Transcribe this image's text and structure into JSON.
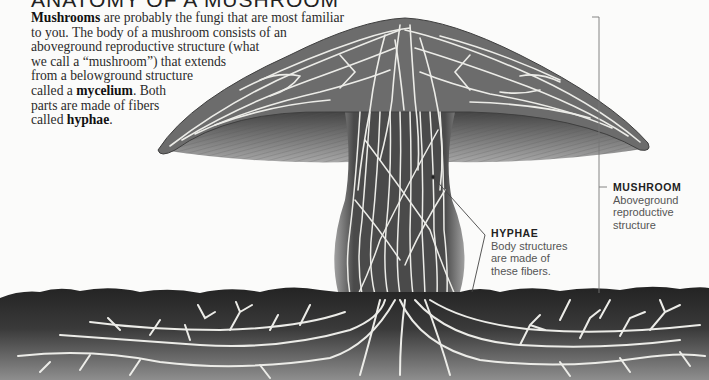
{
  "title": "ANATOMY OF A MUSHROOM",
  "intro": {
    "lines": [
      [
        {
          "text": "Mushrooms",
          "bold": true
        },
        {
          "text": " are probably the fungi that are most familiar",
          "bold": false
        }
      ],
      [
        {
          "text": "to you. The body of a mushroom consists of an",
          "bold": false
        }
      ],
      [
        {
          "text": "aboveground reproductive structure (what",
          "bold": false
        }
      ],
      [
        {
          "text": "we call a “mushroom”) that extends",
          "bold": false
        }
      ],
      [
        {
          "text": "from a belowground structure",
          "bold": false
        }
      ],
      [
        {
          "text": "called a ",
          "bold": false
        },
        {
          "text": "mycelium",
          "bold": true
        },
        {
          "text": ". Both",
          "bold": false
        }
      ],
      [
        {
          "text": "parts are made of fibers",
          "bold": false
        }
      ],
      [
        {
          "text": "called ",
          "bold": false
        },
        {
          "text": "hyphae",
          "bold": true
        },
        {
          "text": ".",
          "bold": false
        }
      ]
    ]
  },
  "callouts": {
    "mushroom": {
      "head": "MUSHROOM",
      "body_lines": [
        "Aboveground",
        "reproductive",
        "structure"
      ]
    },
    "hyphae": {
      "head": "HYPHAE",
      "body_lines": [
        "Body structures",
        "are made of",
        "these fibers."
      ]
    }
  },
  "colors": {
    "background": "#fbfbfa",
    "soil_top": "#262626",
    "soil_bottom": "#8c8c8c",
    "cap_fill": "#6e6e6e",
    "gill_fill": "#8a8a8a",
    "hyphae": "#ecece8",
    "leader_line": "#777777"
  }
}
